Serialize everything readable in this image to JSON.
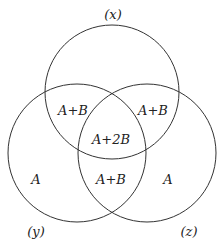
{
  "diagram": {
    "type": "venn",
    "sets": [
      {
        "name": "x",
        "label": "(x)"
      },
      {
        "name": "y",
        "label": "(y)"
      },
      {
        "name": "z",
        "label": "(z)"
      }
    ],
    "regions": {
      "y_only": "A",
      "z_only": "A",
      "x_y": "A+B",
      "x_z": "A+B",
      "y_z": "A+B",
      "x_y_z": "A+2B"
    }
  }
}
